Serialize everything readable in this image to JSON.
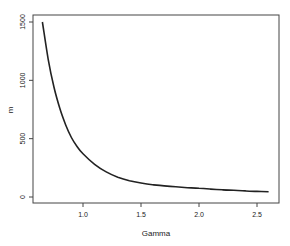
{
  "chart_data": {
    "type": "line",
    "title": "",
    "xlabel": "Gamma",
    "ylabel": "m",
    "xlim": [
      0.6,
      2.72
    ],
    "ylim": [
      -50,
      1560
    ],
    "grid": false,
    "legend": null,
    "x_ticks": [
      1.0,
      1.5,
      2.0,
      2.5
    ],
    "x_tick_labels": [
      "1.0",
      "1.5",
      "2.0",
      "2.5"
    ],
    "y_ticks": [
      0,
      500,
      1000,
      1500
    ],
    "y_tick_labels": [
      "0",
      "500",
      "1000",
      "1500"
    ],
    "series": [
      {
        "name": "m",
        "color": "#222222",
        "x": [
          0.65,
          0.7,
          0.75,
          0.8,
          0.85,
          0.9,
          0.95,
          1.0,
          1.1,
          1.2,
          1.3,
          1.4,
          1.5,
          1.6,
          1.7,
          1.8,
          1.9,
          2.0,
          2.1,
          2.2,
          2.3,
          2.4,
          2.5,
          2.6
        ],
        "y": [
          1500,
          1180,
          940,
          760,
          620,
          510,
          430,
          370,
          280,
          215,
          170,
          140,
          120,
          105,
          95,
          87,
          80,
          75,
          68,
          62,
          57,
          52,
          48,
          45
        ]
      }
    ]
  },
  "axes": {
    "xlabel": "Gamma",
    "ylabel": "m"
  }
}
